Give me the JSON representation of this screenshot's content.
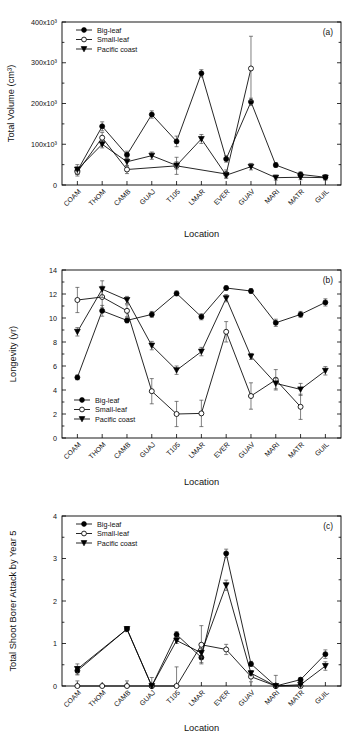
{
  "figure": {
    "x_categories": [
      "COAM",
      "THOM",
      "CAMB",
      "GUAJ",
      "T105",
      "LMAR",
      "EVER",
      "GUAV",
      "MARI",
      "MATR",
      "GUIL"
    ],
    "legend_labels": {
      "big_leaf": "Big-leaf",
      "small_leaf": "Small-leaf",
      "pacific_coast": "Pacific coast"
    },
    "xlabel": "Location"
  },
  "chart_data": [
    {
      "type": "line",
      "panel": "(a)",
      "title": "",
      "xlabel": "Location",
      "ylabel": "Total Volume (cm³)",
      "categories": [
        "COAM",
        "THOM",
        "CAMB",
        "GUAJ",
        "T105",
        "LMAR",
        "EVER",
        "GUAV",
        "MARI",
        "MATR",
        "GUIL"
      ],
      "ylim": [
        0,
        400000
      ],
      "yticks": [
        0,
        100000,
        200000,
        300000,
        400000
      ],
      "ytick_labels": [
        "0",
        "100x10³",
        "200x10³",
        "300x10³",
        "400x10³"
      ],
      "grid": false,
      "legend_position": "top-left",
      "series": [
        {
          "name": "Big-leaf",
          "marker": "filled-circle",
          "values": [
            35000,
            144000,
            74000,
            173000,
            107000,
            274000,
            64000,
            204000,
            49000,
            26000,
            19000
          ],
          "errors": [
            9000,
            11000,
            9000,
            9000,
            13000,
            9000,
            8000,
            9000,
            6000,
            6000,
            6000
          ]
        },
        {
          "name": "Small-leaf",
          "marker": "open-circle",
          "values": [
            32000,
            116000,
            38000,
            null,
            47000,
            null,
            27000,
            286000,
            null,
            null,
            null
          ],
          "errors": [
            10000,
            13000,
            10000,
            null,
            21000,
            null,
            10000,
            79000,
            null,
            null,
            null
          ]
        },
        {
          "name": "Pacific coast",
          "marker": "filled-triangle-down",
          "values": [
            38000,
            100000,
            57000,
            72000,
            48000,
            113000,
            24000,
            45000,
            18000,
            19000,
            18000
          ],
          "errors": [
            12000,
            9000,
            11000,
            9000,
            9000,
            11000,
            7000,
            8000,
            6000,
            6000,
            6000
          ]
        }
      ]
    },
    {
      "type": "line",
      "panel": "(b)",
      "title": "",
      "xlabel": "Location",
      "ylabel": "Longevity (yr)",
      "categories": [
        "COAM",
        "THOM",
        "CAMB",
        "GUAJ",
        "T105",
        "LMAR",
        "EVER",
        "GUAV",
        "MARI",
        "MATR",
        "GUIL"
      ],
      "ylim": [
        0,
        14
      ],
      "yticks": [
        0,
        2,
        4,
        6,
        8,
        10,
        12,
        14
      ],
      "ytick_labels": [
        "0",
        "2",
        "4",
        "6",
        "8",
        "10",
        "12",
        "14"
      ],
      "grid": false,
      "legend_position": "bottom-left",
      "series": [
        {
          "name": "Big-leaf",
          "marker": "filled-circle",
          "values": [
            5.05,
            10.6,
            9.8,
            10.3,
            12.05,
            10.1,
            12.5,
            12.25,
            9.6,
            10.3,
            11.3
          ],
          "errors": [
            0.2,
            0.45,
            0.2,
            0.25,
            0.2,
            0.25,
            0.18,
            0.2,
            0.3,
            0.25,
            0.3
          ]
        },
        {
          "name": "Small-leaf",
          "marker": "open-circle",
          "values": [
            11.5,
            11.75,
            10.6,
            3.9,
            2.0,
            2.05,
            8.85,
            3.5,
            4.85,
            2.6,
            null
          ],
          "errors": [
            1.05,
            0.9,
            0.5,
            1.05,
            1.05,
            1.1,
            0.85,
            1.1,
            0.85,
            1.05,
            null
          ]
        },
        {
          "name": "Pacific coast",
          "marker": "filled-triangle-down",
          "values": [
            8.85,
            12.4,
            11.5,
            7.7,
            5.65,
            7.2,
            11.65,
            6.8,
            4.55,
            4.05,
            5.6
          ],
          "errors": [
            0.35,
            0.7,
            0.3,
            0.35,
            0.35,
            0.35,
            0.3,
            0.25,
            0.45,
            0.5,
            0.35
          ]
        }
      ]
    },
    {
      "type": "line",
      "panel": "(c)",
      "title": "",
      "xlabel": "Location",
      "ylabel": "Total Shoot Borer Attack by Year 5",
      "categories": [
        "COAM",
        "THOM",
        "CAMB",
        "GUAJ",
        "T105",
        "LMAR",
        "EVER",
        "GUAV",
        "MARI",
        "MATR",
        "GUIL"
      ],
      "ylim": [
        0,
        4
      ],
      "yticks": [
        0,
        1,
        2,
        3,
        4
      ],
      "ytick_labels": [
        "0",
        "1",
        "2",
        "3",
        "4"
      ],
      "grid": false,
      "legend_position": "top-left",
      "series": [
        {
          "name": "Big-leaf",
          "marker": "filled-circle",
          "values": [
            0.36,
            null,
            1.34,
            0.0,
            1.21,
            0.67,
            3.12,
            0.52,
            0.0,
            0.15,
            0.75
          ],
          "errors": [
            0.1,
            null,
            0.06,
            0.0,
            0.07,
            0.12,
            0.1,
            0.06,
            0.03,
            0.05,
            0.1
          ]
        },
        {
          "name": "Small-leaf",
          "marker": "open-circle",
          "values": [
            0.0,
            0.0,
            0.0,
            0.0,
            0.0,
            0.97,
            0.86,
            0.22,
            0.0,
            0.0,
            null
          ],
          "errors": [
            0.12,
            0.0,
            0.12,
            0.2,
            0.45,
            0.45,
            0.12,
            0.12,
            0.25,
            0.0,
            null
          ]
        },
        {
          "name": "Pacific coast",
          "marker": "filled-triangle-down",
          "values": [
            0.4,
            null,
            1.34,
            0.0,
            1.07,
            0.78,
            2.37,
            0.3,
            0.0,
            0.03,
            0.47
          ],
          "errors": [
            0.12,
            null,
            0.06,
            0.0,
            0.07,
            0.1,
            0.12,
            0.06,
            0.03,
            0.03,
            0.1
          ]
        }
      ]
    }
  ]
}
